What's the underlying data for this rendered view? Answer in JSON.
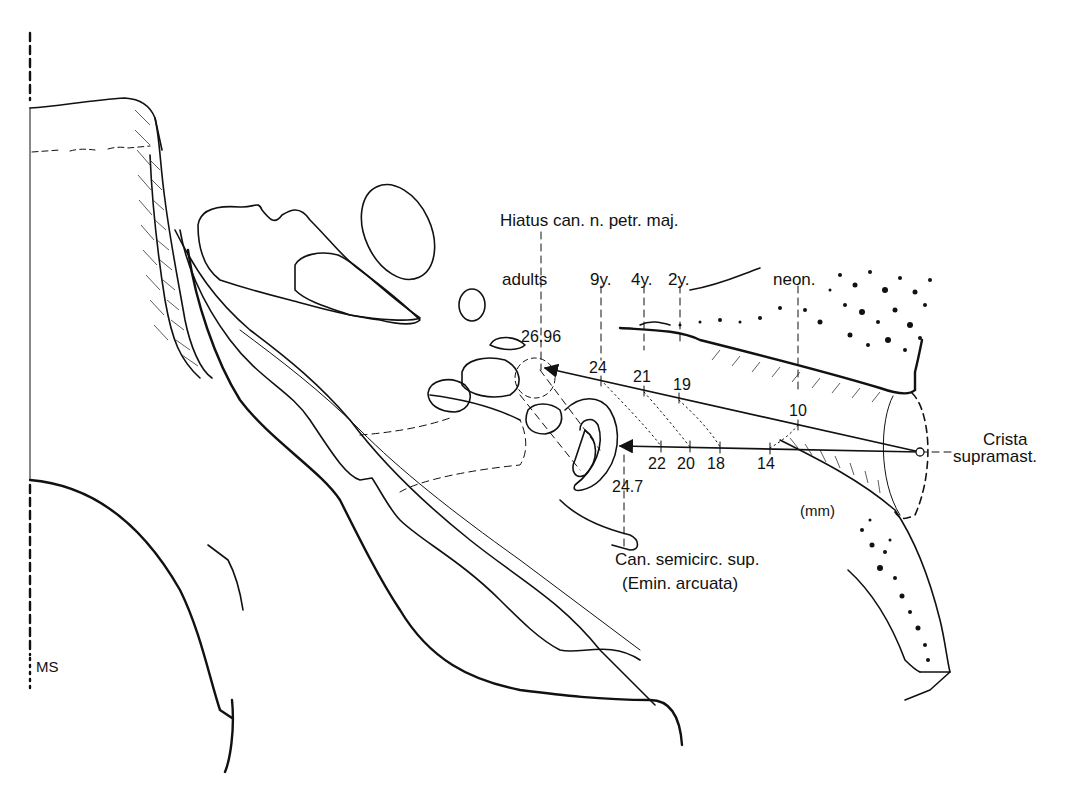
{
  "figure": {
    "title_labels": {
      "hiatus": "Hiatus can. n. petr. maj.",
      "crista_line1": "Crista",
      "crista_line2": "supramast.",
      "canal_line1": "Can. semicirc. sup.",
      "canal_line2": "(Emin. arcuata)",
      "units": "(mm)",
      "midsagittal": "MS"
    },
    "age_groups": [
      {
        "label": "adults",
        "upper_value": "26.96",
        "lower_value": "24.7"
      },
      {
        "label": "9y.",
        "upper_value": "24",
        "lower_value": "22"
      },
      {
        "label": "4y.",
        "upper_value": "21",
        "lower_value": "20"
      },
      {
        "label": "2y.",
        "upper_value": "19",
        "lower_value": "18"
      },
      {
        "label": "neon.",
        "upper_value": "10",
        "lower_value": "14"
      }
    ],
    "measurement_lines": [
      {
        "name": "to-hiatus",
        "from": "Crista supramast.",
        "to": "Hiatus can. n. petr. maj.",
        "values_mm": [
          10,
          19,
          21,
          24,
          26.96
        ]
      },
      {
        "name": "to-eminentia",
        "from": "Crista supramast.",
        "to": "Can. semicirc. sup.",
        "values_mm": [
          14,
          18,
          20,
          22,
          24.7
        ]
      }
    ],
    "colors": {
      "ink": "#111111",
      "background": "#ffffff"
    }
  }
}
